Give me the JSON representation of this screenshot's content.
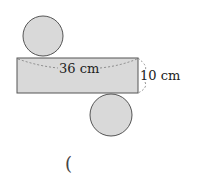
{
  "figure": {
    "type": "cylinder net",
    "colors": {
      "fill": "#d9d9d9",
      "stroke": "#555555",
      "dash": "#777777",
      "text": "#222222"
    },
    "top_circle": {
      "cx": 43,
      "cy": 36,
      "r": 20
    },
    "rectangle": {
      "x": 17,
      "y": 58,
      "width": 121,
      "height": 35
    },
    "bottom_circle": {
      "cx": 111,
      "cy": 115,
      "r": 21
    },
    "labels": {
      "length": "36 cm",
      "height": "10 cm"
    }
  },
  "answer": {
    "open_paren": "("
  }
}
